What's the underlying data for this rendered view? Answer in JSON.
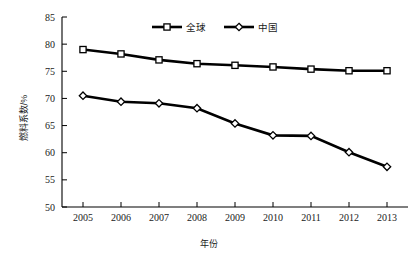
{
  "chart_data": {
    "type": "line",
    "title": "",
    "xlabel": "年份",
    "ylabel": "燃料系数/%",
    "x": [
      "2005",
      "2006",
      "2007",
      "2008",
      "2009",
      "2010",
      "2011",
      "2012",
      "2013"
    ],
    "categories": [
      "2005",
      "2006",
      "2007",
      "2008",
      "2009",
      "2010",
      "2011",
      "2012",
      "2013"
    ],
    "series": [
      {
        "name": "全球",
        "marker": "square",
        "values": [
          79.0,
          78.2,
          77.1,
          76.4,
          76.1,
          75.8,
          75.4,
          75.1,
          75.1
        ]
      },
      {
        "name": "中国",
        "marker": "diamond",
        "values": [
          70.5,
          69.4,
          69.1,
          68.2,
          65.4,
          63.2,
          63.1,
          60.1,
          57.4
        ]
      }
    ],
    "ylim": [
      50,
      85
    ],
    "ytick_step": 5,
    "yticks": [
      "50",
      "55",
      "60",
      "65",
      "70",
      "75",
      "80",
      "85"
    ],
    "grid": false,
    "legend_position": "top-center",
    "line_color": "#000000",
    "marker_fill": "#ffffff",
    "axis_color": "#000000"
  },
  "legend": {
    "entries": [
      {
        "label": "全球",
        "marker": "square"
      },
      {
        "label": "中国",
        "marker": "diamond"
      }
    ]
  },
  "axes": {
    "y_title": "燃料系数/%",
    "x_title": "年份"
  }
}
